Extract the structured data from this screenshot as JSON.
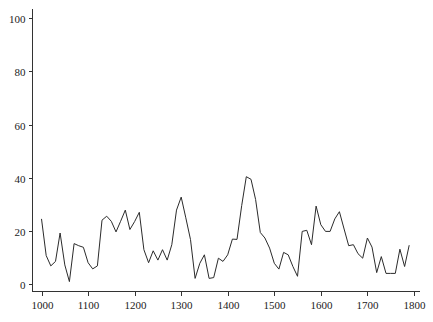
{
  "chart_data": {
    "type": "line",
    "title": "",
    "xlabel": "",
    "ylabel": "",
    "xlim": [
      990,
      1815
    ],
    "ylim": [
      -3,
      103
    ],
    "grid": false,
    "legend": null,
    "x_ticks": [
      1000,
      1100,
      1200,
      1300,
      1400,
      1500,
      1600,
      1700,
      1800
    ],
    "x_tick_labels": [
      "1000",
      "1100",
      "1200",
      "1300",
      "1400",
      "1500",
      "1600",
      "1700",
      "1800"
    ],
    "y_ticks": [
      0,
      20,
      40,
      60,
      80,
      100
    ],
    "y_tick_labels": [
      "0",
      "20",
      "40",
      "60",
      "80",
      "100"
    ],
    "series": [
      {
        "name": "series",
        "color": "#2b2b2b",
        "x": [
          1000,
          1010,
          1020,
          1030,
          1040,
          1050,
          1060,
          1070,
          1080,
          1090,
          1100,
          1110,
          1120,
          1130,
          1140,
          1150,
          1160,
          1170,
          1180,
          1190,
          1200,
          1210,
          1220,
          1230,
          1240,
          1250,
          1260,
          1270,
          1280,
          1290,
          1300,
          1310,
          1320,
          1330,
          1340,
          1350,
          1360,
          1370,
          1380,
          1390,
          1400,
          1410,
          1420,
          1430,
          1440,
          1450,
          1460,
          1470,
          1480,
          1490,
          1500,
          1510,
          1520,
          1530,
          1540,
          1550,
          1560,
          1570,
          1580,
          1590,
          1600,
          1610,
          1620,
          1630,
          1640,
          1650,
          1660,
          1670,
          1680,
          1690,
          1700,
          1710,
          1720,
          1730,
          1740,
          1750,
          1760,
          1770,
          1780,
          1790
        ],
        "values": [
          24.5,
          10.7,
          6.8,
          8.5,
          19.2,
          7.2,
          0.9,
          15.2,
          14.4,
          13.8,
          8,
          5.7,
          6.8,
          24,
          25.5,
          23.6,
          19.6,
          23.6,
          27.8,
          20.5,
          23.5,
          27,
          12.9,
          8,
          12.5,
          9,
          12.9,
          9,
          14.8,
          27.8,
          32.7,
          24.9,
          16.7,
          2.1,
          7.8,
          11,
          2.1,
          2.4,
          9.7,
          8.5,
          11,
          16.9,
          16.8,
          29.5,
          40.4,
          39.4,
          31.8,
          19.4,
          17.3,
          13.5,
          7.8,
          5.6,
          11.9,
          11,
          6.6,
          2.9,
          19.8,
          20.2,
          14.8,
          29.3,
          22.3,
          19.8,
          19.8,
          24.5,
          27.2,
          20.7,
          14.4,
          14.8,
          11.4,
          9.7,
          17.3,
          13.9,
          4.3,
          10.3,
          4,
          4,
          4,
          13.1,
          6.6,
          14.6
        ]
      }
    ]
  },
  "axes": {
    "y_axis_x": 32.5,
    "x_axis_y": 291.5,
    "y_axis_top": 9,
    "x_axis_right": 420,
    "plot_x0_value": 1000,
    "plot_x0_px": 41.5,
    "px_per_x_unit": 0.4655,
    "plot_y0_value": 0,
    "plot_y0_px": 284,
    "px_per_y_unit": 2.657
  }
}
